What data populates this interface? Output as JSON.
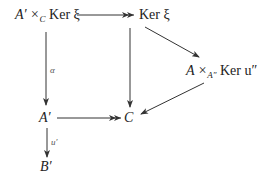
{
  "diagram": {
    "type": "commutative-diagram",
    "nodes": {
      "pullback_kernel": {
        "main": "A′ ×",
        "sub": "C",
        "rest": " Ker ξ"
      },
      "ker_xi": {
        "text": "Ker ξ"
      },
      "fiber_product": {
        "main": "A ×",
        "sub": "A″",
        "rest": " Ker u″"
      },
      "a_prime": {
        "text": "A′"
      },
      "c": {
        "text": "C"
      },
      "b_prime": {
        "text": "B′"
      }
    },
    "arrow_labels": {
      "alpha": "α",
      "u_prime": "u′"
    },
    "edges": [
      {
        "from": "A′ ×_C Ker ξ",
        "to": "Ker ξ",
        "style": "epi (double head)"
      },
      {
        "from": "A′ ×_C Ker ξ",
        "to": "A′",
        "label": "α"
      },
      {
        "from": "Ker ξ",
        "to": "C"
      },
      {
        "from": "Ker ξ",
        "to": "A ×_A″ Ker u″"
      },
      {
        "from": "A ×_A″ Ker u″",
        "to": "C"
      },
      {
        "from": "A′",
        "to": "C",
        "style": "epi (double head)"
      },
      {
        "from": "A′",
        "to": "B′",
        "label": "u′"
      }
    ]
  }
}
